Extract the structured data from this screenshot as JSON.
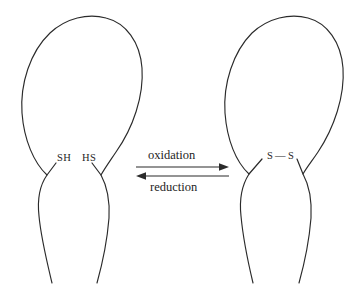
{
  "figure": {
    "background_color": "#ffffff",
    "ink_color": "#2b2b2b"
  },
  "left_molecule": {
    "name": "reduced-protein",
    "thiol_left_label": "SH",
    "thiol_right_label": "HS"
  },
  "right_molecule": {
    "name": "oxidized-protein",
    "sulfur_left_label": "S",
    "sulfur_right_label": "S",
    "bond_symbol": "—"
  },
  "reaction": {
    "forward_label": "oxidation",
    "reverse_label": "reduction"
  }
}
